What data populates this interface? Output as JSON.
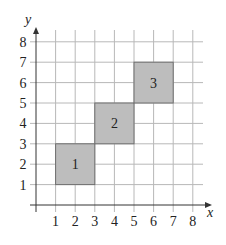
{
  "figure": {
    "x_axis_label": "x",
    "y_axis_label": "y",
    "x_ticks": [
      "1",
      "2",
      "3",
      "4",
      "5",
      "6",
      "7",
      "8"
    ],
    "y_ticks": [
      "1",
      "2",
      "3",
      "4",
      "5",
      "6",
      "7",
      "8"
    ],
    "grid": true,
    "squares": [
      {
        "label": "1",
        "x0": 1,
        "y0": 1,
        "x1": 3,
        "y1": 3
      },
      {
        "label": "2",
        "x0": 3,
        "y0": 3,
        "x1": 5,
        "y1": 5
      },
      {
        "label": "3",
        "x0": 5,
        "y0": 5,
        "x1": 7,
        "y1": 7
      }
    ],
    "colors": {
      "square_fill": "#bdbdbd",
      "square_stroke": "#6e6e6e",
      "grid": "#b8b8b8",
      "axis": "#333333"
    }
  }
}
